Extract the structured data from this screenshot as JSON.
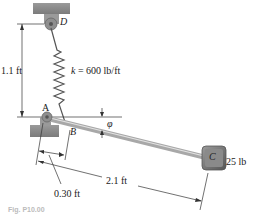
{
  "diagram": {
    "type": "mechanics-figure",
    "points": {
      "D": "D",
      "A": "A",
      "B": "B",
      "C": "C"
    },
    "labels": {
      "spring_constant": "k = 600 lb/ft",
      "height": "1.1 ft",
      "angle": "φ",
      "short_length": "0.30 ft",
      "long_length": "2.1 ft",
      "weight": "25 lb"
    },
    "caption": "Fig. P10.00",
    "colors": {
      "support": "#8a8a8a",
      "rod": "#b9b9b9",
      "block": "#6e6e6e",
      "line": "#333333",
      "spring": "#555555"
    }
  }
}
